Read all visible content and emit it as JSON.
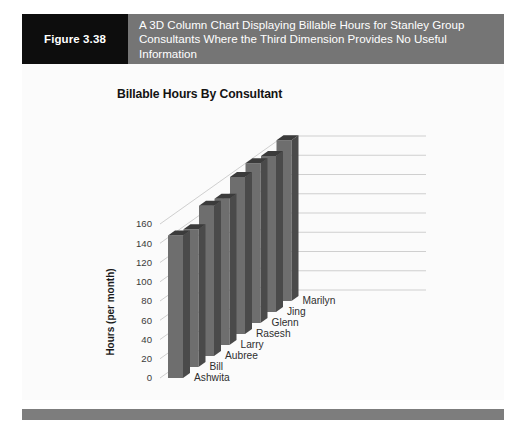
{
  "figure": {
    "number_label": "Figure 3.38",
    "caption": "A 3D Column Chart Displaying Billable Hours for Stanley Group Consultants Where the Third Dimension Provides No Useful Information"
  },
  "colors": {
    "header_band": "#757575",
    "figure_number_block": "#0d0d0d",
    "caption_text": "#ffffff",
    "chart_background": "#fbfbfb",
    "bar_front": "#6e6e6e",
    "bar_side": "#4a4a4a",
    "bar_top": "#3b3b3b",
    "gridline": "#c9c9c9",
    "footer_bar": "#7d7d7d"
  },
  "chart_data": {
    "type": "bar",
    "title": "Billable Hours By Consultant",
    "xlabel": "",
    "ylabel": "Hours (per month)",
    "categories": [
      "Ashwita",
      "Bill",
      "Aubree",
      "Larry",
      "Rasesh",
      "Glenn",
      "Jing",
      "Marilyn"
    ],
    "values": [
      148,
      143,
      156,
      152,
      163,
      166,
      162,
      167
    ],
    "ylim": [
      0,
      160
    ],
    "yticks": [
      0,
      20,
      40,
      60,
      80,
      100,
      120,
      140,
      160
    ],
    "ytick_labels": [
      "0",
      "20",
      "40",
      "60",
      "80",
      "100",
      "120",
      "140",
      "160"
    ],
    "grid": true,
    "legend": false,
    "three_d": true,
    "note": "3D column chart; depth axis adds no information"
  }
}
